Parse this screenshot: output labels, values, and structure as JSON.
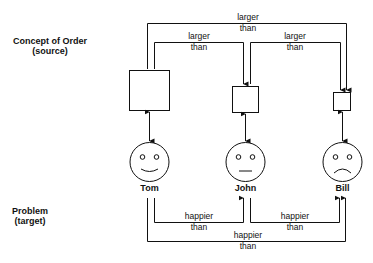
{
  "source_label": {
    "line1": "Concept of Order",
    "line2": "(source)"
  },
  "target_label": {
    "line1": "Problem",
    "line2": "(target)"
  },
  "source_relations": [
    {
      "from": "big-square",
      "to": "medium-square",
      "line1": "larger",
      "line2": "than"
    },
    {
      "from": "medium-square",
      "to": "small-square",
      "line1": "larger",
      "line2": "than"
    },
    {
      "from": "big-square",
      "to": "small-square",
      "line1": "larger",
      "line2": "than"
    }
  ],
  "target_relations": [
    {
      "from": "Tom",
      "to": "John",
      "line1": "happier",
      "line2": "than"
    },
    {
      "from": "John",
      "to": "Bill",
      "line1": "happier",
      "line2": "than"
    },
    {
      "from": "Tom",
      "to": "Bill",
      "line1": "happier",
      "line2": "than"
    }
  ],
  "people": [
    {
      "name": "Tom",
      "expression": "smile"
    },
    {
      "name": "John",
      "expression": "neutral"
    },
    {
      "name": "Bill",
      "expression": "frown"
    }
  ],
  "squares": [
    "big",
    "medium",
    "small"
  ],
  "colors": {
    "stroke": "#111111",
    "background": "#ffffff"
  }
}
